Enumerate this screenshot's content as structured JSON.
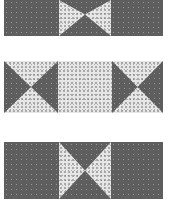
{
  "colors": {
    "dark_fabric": "#5e5e5e",
    "light_fabric": "#e6e6e6",
    "background": "#ffffff"
  },
  "rows": [
    {
      "name": "top-strip",
      "pattern": "dark-square, hourglass-light-sides, dark-square"
    },
    {
      "name": "middle-strip",
      "pattern": "hourglass-dark-sides, light-square, hourglass-dark-sides"
    },
    {
      "name": "bottom-strip",
      "pattern": "dark-square, hourglass-light-sides, dark-square"
    }
  ]
}
